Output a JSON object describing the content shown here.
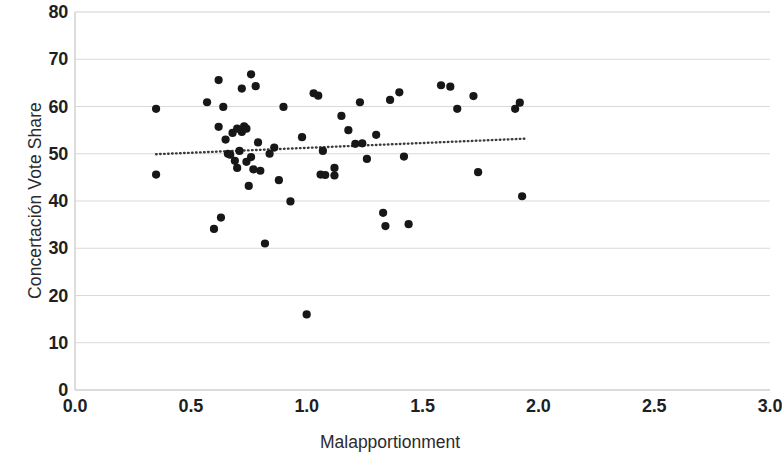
{
  "chart_data": {
    "type": "scatter",
    "title": "",
    "xlabel": "Malapportionment",
    "ylabel": "Concertación Vote Share",
    "xlim": [
      0.0,
      3.0
    ],
    "ylim": [
      0,
      80
    ],
    "xticks": [
      "0.0",
      "0.5",
      "1.0",
      "1.5",
      "2.0",
      "2.5",
      "3.0"
    ],
    "xtick_values": [
      0.0,
      0.5,
      1.0,
      1.5,
      2.0,
      2.5,
      3.0
    ],
    "yticks": [
      "0",
      "10",
      "20",
      "30",
      "40",
      "50",
      "60",
      "70",
      "80"
    ],
    "ytick_values": [
      0,
      10,
      20,
      30,
      40,
      50,
      60,
      70,
      80
    ],
    "grid": "horizontal",
    "grid_color": "#d9d9d9",
    "legend": "none",
    "marker_color": "#171717",
    "marker_size": 6,
    "points": [
      {
        "x": 0.35,
        "y": 59.5
      },
      {
        "x": 0.35,
        "y": 45.6
      },
      {
        "x": 0.57,
        "y": 60.9
      },
      {
        "x": 0.6,
        "y": 34.1
      },
      {
        "x": 0.62,
        "y": 65.6
      },
      {
        "x": 0.62,
        "y": 55.7
      },
      {
        "x": 0.63,
        "y": 36.5
      },
      {
        "x": 0.64,
        "y": 59.9
      },
      {
        "x": 0.65,
        "y": 53.0
      },
      {
        "x": 0.66,
        "y": 50.0
      },
      {
        "x": 0.67,
        "y": 49.8
      },
      {
        "x": 0.68,
        "y": 54.4
      },
      {
        "x": 0.69,
        "y": 48.5
      },
      {
        "x": 0.7,
        "y": 47.0
      },
      {
        "x": 0.7,
        "y": 55.3
      },
      {
        "x": 0.71,
        "y": 50.6
      },
      {
        "x": 0.72,
        "y": 63.8
      },
      {
        "x": 0.72,
        "y": 54.6
      },
      {
        "x": 0.73,
        "y": 55.8
      },
      {
        "x": 0.74,
        "y": 48.3
      },
      {
        "x": 0.74,
        "y": 55.3
      },
      {
        "x": 0.75,
        "y": 43.2
      },
      {
        "x": 0.76,
        "y": 66.8
      },
      {
        "x": 0.76,
        "y": 49.3
      },
      {
        "x": 0.77,
        "y": 46.7
      },
      {
        "x": 0.78,
        "y": 64.3
      },
      {
        "x": 0.79,
        "y": 52.4
      },
      {
        "x": 0.8,
        "y": 46.4
      },
      {
        "x": 0.82,
        "y": 31.0
      },
      {
        "x": 0.84,
        "y": 50.0
      },
      {
        "x": 0.86,
        "y": 51.3
      },
      {
        "x": 0.88,
        "y": 44.4
      },
      {
        "x": 0.9,
        "y": 59.9
      },
      {
        "x": 0.93,
        "y": 39.9
      },
      {
        "x": 0.98,
        "y": 53.5
      },
      {
        "x": 1.0,
        "y": 16.0
      },
      {
        "x": 1.03,
        "y": 62.8
      },
      {
        "x": 1.05,
        "y": 62.3
      },
      {
        "x": 1.06,
        "y": 45.6
      },
      {
        "x": 1.07,
        "y": 50.6
      },
      {
        "x": 1.08,
        "y": 45.5
      },
      {
        "x": 1.12,
        "y": 47.0
      },
      {
        "x": 1.12,
        "y": 45.4
      },
      {
        "x": 1.15,
        "y": 58.0
      },
      {
        "x": 1.18,
        "y": 55.0
      },
      {
        "x": 1.21,
        "y": 52.1
      },
      {
        "x": 1.23,
        "y": 60.9
      },
      {
        "x": 1.24,
        "y": 52.2
      },
      {
        "x": 1.26,
        "y": 48.9
      },
      {
        "x": 1.3,
        "y": 54.0
      },
      {
        "x": 1.33,
        "y": 37.5
      },
      {
        "x": 1.34,
        "y": 34.7
      },
      {
        "x": 1.36,
        "y": 61.4
      },
      {
        "x": 1.4,
        "y": 63.0
      },
      {
        "x": 1.42,
        "y": 49.4
      },
      {
        "x": 1.44,
        "y": 35.1
      },
      {
        "x": 1.58,
        "y": 64.5
      },
      {
        "x": 1.62,
        "y": 64.2
      },
      {
        "x": 1.65,
        "y": 59.5
      },
      {
        "x": 1.72,
        "y": 62.2
      },
      {
        "x": 1.74,
        "y": 46.1
      },
      {
        "x": 1.9,
        "y": 59.5
      },
      {
        "x": 1.92,
        "y": 60.8
      },
      {
        "x": 1.93,
        "y": 41.0
      }
    ],
    "trendline": {
      "style": "dotted",
      "color": "#3a3a3a",
      "x_start": 0.35,
      "y_start": 49.9,
      "x_end": 1.95,
      "y_end": 53.2
    }
  }
}
